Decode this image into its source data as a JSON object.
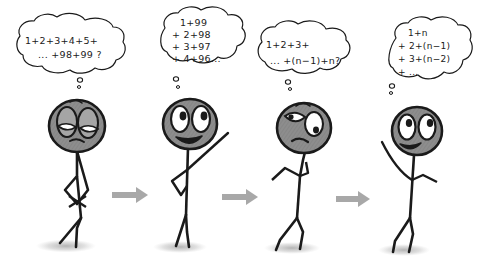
{
  "comic": {
    "title": "Stick figure summation series",
    "panel_count": 4,
    "background_color": "#ffffff",
    "ink_color": "#1a1a1a",
    "head_fill_color": "#8f8f8f",
    "shadow_color": "#b5b5b5",
    "arrow_color": "#a8a8a8"
  },
  "panels": [
    {
      "id": "panel-1",
      "thought": {
        "lines": [
          "1+2+3+4+5+",
          "... +98+99 ?"
        ]
      },
      "figure": {
        "expression": "tired-frown",
        "pose": "arms-crossed-slouching"
      }
    },
    {
      "id": "panel-2",
      "thought": {
        "lines": [
          "1+99",
          "+ 2+98",
          "+ 3+97",
          "+ 4+96..."
        ]
      },
      "figure": {
        "expression": "happy-smile-wide-eyes",
        "pose": "one-arm-raised"
      }
    },
    {
      "id": "panel-3",
      "thought": {
        "lines": [
          "1+2+3+",
          "... +(n−1)+n?"
        ]
      },
      "figure": {
        "expression": "puzzled-frown-looking-up",
        "pose": "hand-to-chin"
      }
    },
    {
      "id": "panel-4",
      "thought": {
        "lines": [
          "1+n",
          "+ 2+(n−1)",
          "+ 3+(n−2)",
          "+ ..."
        ]
      },
      "figure": {
        "expression": "happy-smile-wide-eyes",
        "pose": "arms-open"
      }
    }
  ],
  "arrows": [
    {
      "id": "arrow-1",
      "label": "then"
    },
    {
      "id": "arrow-2",
      "label": "then"
    },
    {
      "id": "arrow-3",
      "label": "then"
    }
  ]
}
